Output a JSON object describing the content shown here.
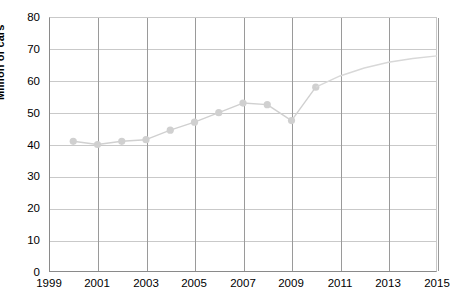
{
  "chart_data": {
    "type": "line",
    "title": "",
    "xlabel": "",
    "ylabel": "Million of cars",
    "xlim": [
      1999,
      2015
    ],
    "ylim": [
      0,
      80
    ],
    "xticks": [
      1999,
      2001,
      2003,
      2005,
      2007,
      2009,
      2011,
      2013,
      2015
    ],
    "yticks": [
      0,
      10,
      20,
      30,
      40,
      50,
      60,
      70,
      80
    ],
    "grid": true,
    "legend": null,
    "series": [
      {
        "name": "Million of cars",
        "marker": "circle",
        "color": "#d0d0d0",
        "x": [
          2000,
          2001,
          2002,
          2003,
          2004,
          2005,
          2006,
          2007,
          2008,
          2009,
          2010
        ],
        "values": [
          41,
          40,
          41,
          41.5,
          44.5,
          47,
          50,
          53,
          52.5,
          47.5,
          58
        ]
      },
      {
        "name": "Projection",
        "marker": "none",
        "color": "#d8d8d8",
        "x": [
          2010,
          2011,
          2012,
          2013,
          2014,
          2015
        ],
        "values": [
          58,
          61.5,
          64,
          65.8,
          67,
          67.8
        ]
      }
    ]
  },
  "axes": {
    "y_title": "Million of cars",
    "y_tick_labels": [
      "80",
      "70",
      "60",
      "50",
      "40",
      "30",
      "20",
      "10",
      "0"
    ],
    "x_tick_labels": [
      "1999",
      "2001",
      "2003",
      "2005",
      "2007",
      "2009",
      "2011",
      "2013",
      "2015"
    ]
  },
  "colors": {
    "marker": "#d0d0d0",
    "line": "#d8d8d8",
    "grid_minor": "#c9c9c9",
    "grid_major": "#9a9a9a",
    "axis": "#8a8a8a",
    "text": "#000000"
  }
}
